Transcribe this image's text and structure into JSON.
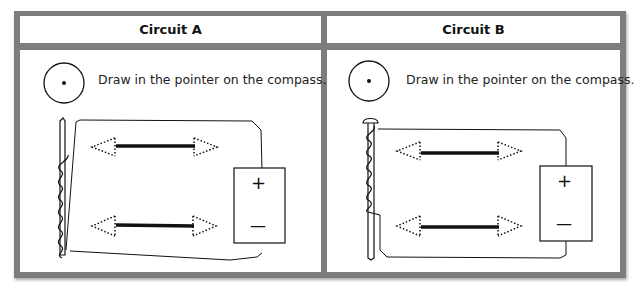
{
  "panels": [
    {
      "title": "Circuit A",
      "instruction": "Draw in the pointer on the compass.",
      "battery": {
        "positive": "+",
        "negative": "—"
      }
    },
    {
      "title": "Circuit B",
      "instruction": "Draw in the pointer on the compass.",
      "battery": {
        "positive": "+",
        "negative": "—"
      }
    }
  ],
  "colors": {
    "frame": "#7d7d7d",
    "ink": "#111111",
    "background": "#ffffff"
  }
}
